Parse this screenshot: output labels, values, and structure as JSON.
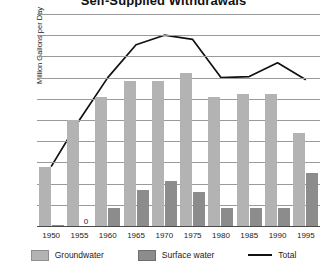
{
  "chart_data": {
    "type": "bar",
    "title": "Self-Supplied Withdrawals",
    "xlabel": "",
    "ylabel": "Million Gallons per Day",
    "ylim": [
      0,
      1000
    ],
    "ytick_labels": [
      "1,000",
      "900",
      "800",
      "700",
      "600",
      "500",
      "400",
      "300",
      "200",
      "100",
      "0"
    ],
    "ytick_values": [
      1000,
      900,
      800,
      700,
      600,
      500,
      400,
      300,
      200,
      100,
      0
    ],
    "grid": true,
    "legend_position": "bottom",
    "categories": [
      "1950",
      "1955",
      "1960",
      "1965",
      "1970",
      "1975",
      "1980",
      "1985",
      "1990",
      "1995"
    ],
    "series": [
      {
        "name": "Groundwater",
        "kind": "bar",
        "color": "#b3b3b3",
        "values": [
          280,
          500,
          610,
          685,
          685,
          720,
          610,
          625,
          625,
          440
        ]
      },
      {
        "name": "Surface water",
        "kind": "bar",
        "color": "#8c8c8c",
        "values": [
          5,
          0,
          85,
          170,
          210,
          160,
          85,
          85,
          85,
          250
        ]
      },
      {
        "name": "Total",
        "kind": "line",
        "color": "#111111",
        "values": [
          280,
          500,
          700,
          855,
          900,
          880,
          700,
          705,
          770,
          690
        ]
      }
    ],
    "point_labels": [
      {
        "series": "Surface water",
        "category": "1955",
        "text": "0"
      }
    ]
  },
  "legend": {
    "items": [
      {
        "label": "Groundwater",
        "icon": "square-swatch-light"
      },
      {
        "label": "Surface water",
        "icon": "square-swatch-dark"
      },
      {
        "label": "Total",
        "icon": "line-swatch"
      }
    ]
  }
}
